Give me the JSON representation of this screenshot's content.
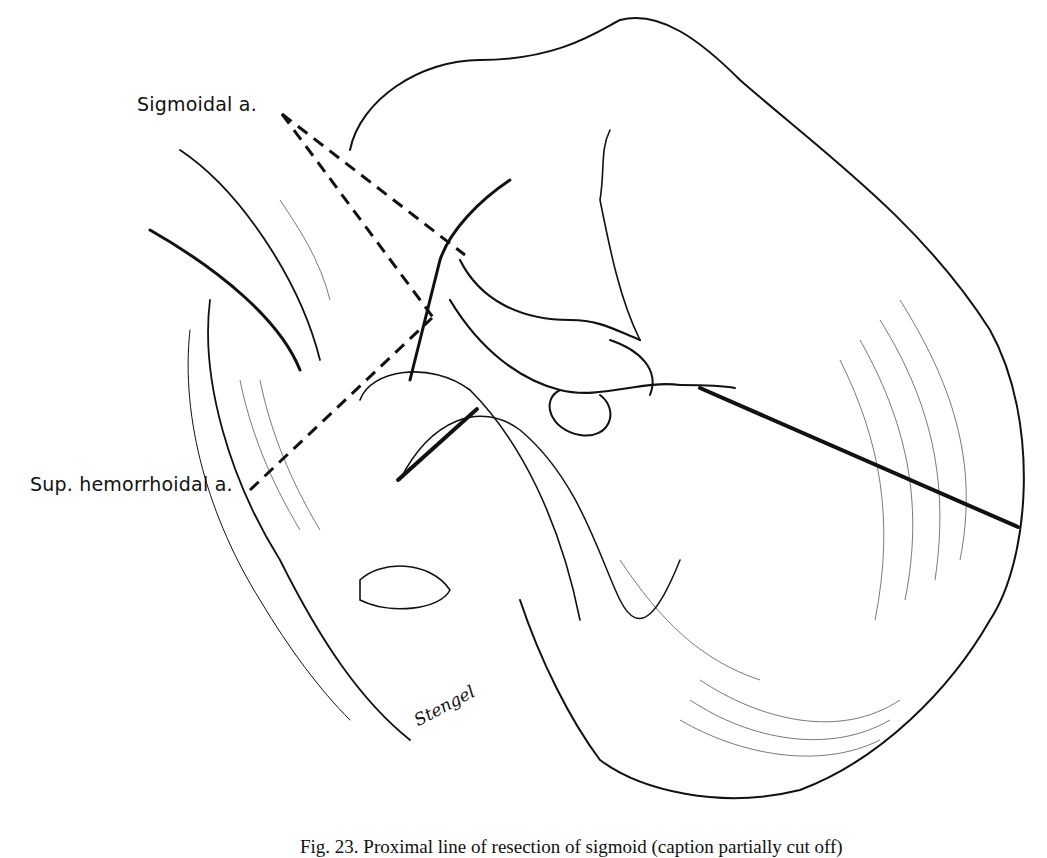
{
  "figure": {
    "type": "surgical line illustration",
    "colors": {
      "ink": "#111111",
      "background": "#ffffff"
    },
    "labels": {
      "sigmoidal_artery": "Sigmoidal a.",
      "superior_hemorrhoidal_artery": "Sup. hemorrhoidal a."
    },
    "signature": "Stengel",
    "caption": "Fig. 23. Proximal line of resection of sigmoid (caption partially cut off)"
  }
}
